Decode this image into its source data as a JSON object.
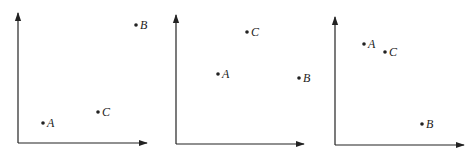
{
  "diagram": {
    "title": "",
    "colors": {
      "ink": "#222222",
      "background": "#ffffff"
    },
    "panels": [
      {
        "id": "panel-1",
        "axes": {
          "origin": [
            18,
            143
          ],
          "y_top": 13,
          "x_right": 147
        },
        "points": [
          {
            "label": "A",
            "x": 43,
            "y": 123
          },
          {
            "label": "B",
            "x": 136,
            "y": 25
          },
          {
            "label": "C",
            "x": 98,
            "y": 112
          }
        ]
      },
      {
        "id": "panel-2",
        "axes": {
          "origin": [
            176,
            144
          ],
          "y_top": 15,
          "x_right": 304
        },
        "points": [
          {
            "label": "A",
            "x": 218,
            "y": 74
          },
          {
            "label": "B",
            "x": 299,
            "y": 78
          },
          {
            "label": "C",
            "x": 247,
            "y": 32
          }
        ]
      },
      {
        "id": "panel-3",
        "axes": {
          "origin": [
            335,
            145
          ],
          "y_top": 17,
          "x_right": 464
        },
        "points": [
          {
            "label": "A",
            "x": 364,
            "y": 44
          },
          {
            "label": "B",
            "x": 422,
            "y": 124
          },
          {
            "label": "C",
            "x": 385,
            "y": 52
          }
        ]
      }
    ]
  }
}
